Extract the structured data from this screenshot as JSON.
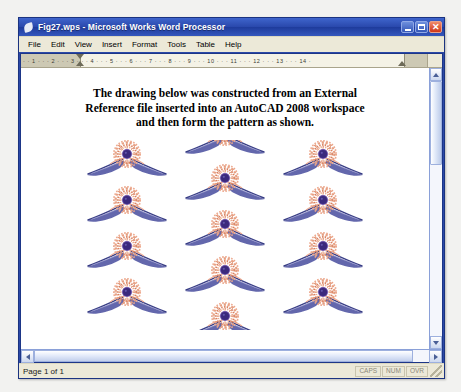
{
  "window": {
    "title": "Fig27.wps - Microsoft Works Word Processor",
    "icon": "works-document-icon",
    "caption": {
      "minimize_label": "Minimize",
      "maximize_label": "Maximize",
      "close_label": "Close"
    }
  },
  "menu": {
    "items": [
      {
        "label": "File"
      },
      {
        "label": "Edit"
      },
      {
        "label": "View"
      },
      {
        "label": "Insert"
      },
      {
        "label": "Format"
      },
      {
        "label": "Tools"
      },
      {
        "label": "Table"
      },
      {
        "label": "Help"
      }
    ]
  },
  "ruler": {
    "left_marks": "2 · · · 1 · · · ",
    "marks": "· · 1 · · · 2 · · · 3 · · · 4 · · · 5 · · · 6 · · · 7 · · · 8 · · · 9 · · · 10 · · · 11 · · · 12 · · · 13 · · · 14 ·"
  },
  "document": {
    "heading_lines": [
      "The drawing below was constructed from an External",
      "Reference file inserted into an AutoCAD 2008 workspace",
      "and then form the pattern as shown."
    ],
    "graphic": {
      "name": "autocad-xref-ornament-pattern",
      "description": "Repeating floral rosette motif with swept wings, arranged in three columns",
      "columns": [
        {
          "motif_count": 4,
          "x": 0.255,
          "y_start": 0.055,
          "y_step": 0.245
        },
        {
          "motif_count": 5,
          "x": 0.5,
          "y_start": -0.055,
          "y_step": 0.245
        },
        {
          "motif_count": 4,
          "x": 0.745,
          "y_start": 0.055,
          "y_step": 0.245
        }
      ],
      "colors": {
        "petal": "#eda98e",
        "petal_dark": "#d9805f",
        "center": "#3b2a7d",
        "center_ring": "#6a4fa8",
        "wing": "#5b5fa8",
        "wing_dark": "#3a3f86"
      }
    }
  },
  "scrollbars": {
    "vertical": {
      "up": "scroll-up",
      "down": "scroll-down",
      "thumb_position_pct": 0
    },
    "horizontal": {
      "left": "scroll-left",
      "right": "scroll-right",
      "thumb_width_pct": 96
    }
  },
  "status": {
    "page_text": "Page 1 of 1",
    "indicators": [
      {
        "label": "CAPS"
      },
      {
        "label": "NUM"
      },
      {
        "label": "OVR"
      }
    ]
  },
  "theme": {
    "title_bar_blue": "#2b49a8",
    "chrome_beige": "#ece9d8",
    "close_red": "#cf3516",
    "page_white": "#ffffff"
  }
}
